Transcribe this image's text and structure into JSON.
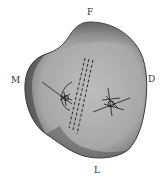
{
  "labels": {
    "top": "F",
    "left": "M",
    "right": "D",
    "bottom": "L"
  },
  "colors": {
    "bone_fill": "#9a9a9a",
    "bone_light": "#b8b8b8",
    "bone_dark": "#4a4a4a",
    "marks": "#1a1a1a"
  }
}
